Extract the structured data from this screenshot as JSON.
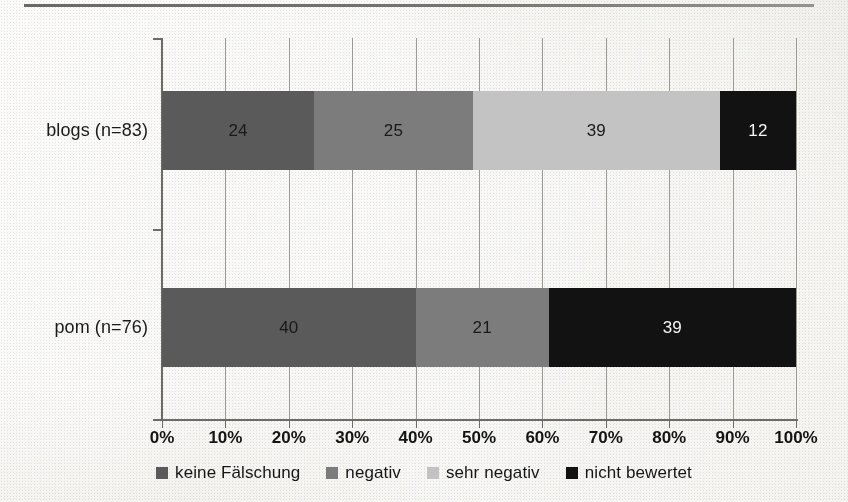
{
  "chart_data": {
    "type": "bar",
    "subtype": "stacked-horizontal-100pct",
    "title": "",
    "xlabel": "",
    "ylabel": "",
    "categories": [
      "blogs (n=83)",
      "pom (n=76)"
    ],
    "series": [
      {
        "name": "keine Fälschung",
        "color": "#5a5a5a",
        "values": [
          24,
          40
        ]
      },
      {
        "name": "negativ",
        "color": "#7c7c7c",
        "values": [
          25,
          21
        ]
      },
      {
        "name": "sehr negativ",
        "color": "#c3c3c3",
        "values": [
          39,
          0
        ]
      },
      {
        "name": "nicht bewertet",
        "color": "#121212",
        "values": [
          12,
          39
        ]
      }
    ],
    "xlim": [
      0,
      100
    ],
    "xticks": [
      0,
      10,
      20,
      30,
      40,
      50,
      60,
      70,
      80,
      90,
      100
    ],
    "xtick_labels": [
      "0%",
      "10%",
      "20%",
      "30%",
      "40%",
      "50%",
      "60%",
      "70%",
      "80%",
      "90%",
      "100%"
    ],
    "grid": true,
    "grid_axis": "x",
    "legend_position": "bottom",
    "value_labels": {
      "blogs (n=83)": [
        "24",
        "25",
        "39",
        "12"
      ],
      "pom (n=76)": [
        "40",
        "21",
        "39"
      ]
    }
  },
  "axis": {
    "tick_labels": [
      "0%",
      "10%",
      "20%",
      "30%",
      "40%",
      "50%",
      "60%",
      "70%",
      "80%",
      "90%",
      "100%"
    ]
  },
  "categories": {
    "blogs": "blogs (n=83)",
    "pom": "pom (n=76)"
  },
  "bars": {
    "blogs": [
      {
        "label": "24",
        "value": 24,
        "series": "keine Fälschung",
        "color": "#5a5a5a",
        "text": "dark"
      },
      {
        "label": "25",
        "value": 25,
        "series": "negativ",
        "color": "#7c7c7c",
        "text": "dark"
      },
      {
        "label": "39",
        "value": 39,
        "series": "sehr negativ",
        "color": "#c3c3c3",
        "text": "dark"
      },
      {
        "label": "12",
        "value": 12,
        "series": "nicht bewertet",
        "color": "#121212",
        "text": "light"
      }
    ],
    "pom": [
      {
        "label": "40",
        "value": 40,
        "series": "keine Fälschung",
        "color": "#5a5a5a",
        "text": "dark"
      },
      {
        "label": "21",
        "value": 21,
        "series": "negativ",
        "color": "#7c7c7c",
        "text": "dark"
      },
      {
        "label": "39",
        "value": 39,
        "series": "nicht bewertet",
        "color": "#121212",
        "text": "light"
      }
    ]
  },
  "legend": {
    "items": [
      {
        "label": "keine Fälschung",
        "color": "#5a5a5a"
      },
      {
        "label": "negativ",
        "color": "#7c7c7c"
      },
      {
        "label": "sehr negativ",
        "color": "#c3c3c3"
      },
      {
        "label": "nicht bewertet",
        "color": "#121212"
      }
    ]
  },
  "colors": {
    "keine_faelschung": "#5a5a5a",
    "negativ": "#7c7c7c",
    "sehr_negativ": "#c3c3c3",
    "nicht_bewertet": "#121212",
    "axis": "#6e6b66",
    "gridline": "#8d8a85",
    "paper": "#efeeea"
  }
}
